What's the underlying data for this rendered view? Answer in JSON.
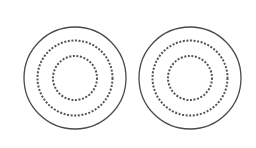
{
  "diagram": {
    "background": "#ffffff",
    "stroke_color": "#4a4a4a",
    "dot_color": "#555555",
    "groups": [
      {
        "name": "left-concentric-circles",
        "cx": 75,
        "cy": 78,
        "outer": {
          "r": 51,
          "style": "solid",
          "width": 1.3
        },
        "middle": {
          "r": 37.5,
          "style": "dotted",
          "width": 2
        },
        "inner": {
          "r": 22,
          "style": "dotted",
          "width": 2
        }
      },
      {
        "name": "right-concentric-circles",
        "cx": 190,
        "cy": 78,
        "outer": {
          "r": 51,
          "style": "solid",
          "width": 1.3
        },
        "middle": {
          "r": 37.5,
          "style": "dotted",
          "width": 2
        },
        "inner": {
          "r": 22,
          "style": "dotted",
          "width": 2
        }
      }
    ]
  }
}
